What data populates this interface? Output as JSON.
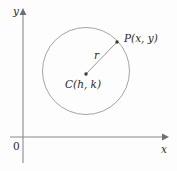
{
  "figure": {
    "background_color": "#fdfdfd",
    "stroke_color": "#8a8a8a",
    "text_color": "#2b2b2b"
  },
  "axes": {
    "y_axis_label": "y",
    "x_axis_label": "x",
    "origin_label": "0",
    "x_axis_y_px": 137,
    "y_axis_x_px": 23,
    "x_axis_start_px": 10,
    "x_axis_end_px": 167,
    "y_axis_top_px": 10,
    "y_axis_bottom_px": 163
  },
  "circle": {
    "center_x_px": 86,
    "center_y_px": 71,
    "radius_px": 43.5,
    "fill": "none",
    "stroke_width": 0.9
  },
  "points": {
    "center": {
      "label": "C(h, k)",
      "x_px": 86,
      "y_px": 74,
      "dot_radius_px": 1.7
    },
    "on_circle": {
      "label": "P(x, y)",
      "x_px": 117,
      "y_px": 42,
      "dot_radius_px": 1.7
    }
  },
  "radius_segment": {
    "label": "r",
    "from_x_px": 86,
    "from_y_px": 74,
    "to_x_px": 117,
    "to_y_px": 42
  }
}
